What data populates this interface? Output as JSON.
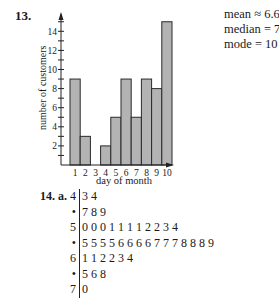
{
  "problem13": {
    "number": "13.",
    "stats": {
      "mean": "mean ≈ 6.63",
      "median": "median = 7",
      "mode": "mode = 10"
    }
  },
  "chart_data": {
    "type": "bar",
    "title": "",
    "xlabel": "day of month",
    "ylabel": "number of customers",
    "categories": [
      "1",
      "2",
      "3",
      "4",
      "5",
      "6",
      "7",
      "8",
      "9",
      "10"
    ],
    "values": [
      9,
      3,
      0,
      2,
      5,
      9,
      5,
      9,
      8,
      15
    ],
    "ylim": [
      0,
      16
    ],
    "yticks": [
      2,
      4,
      6,
      8,
      10,
      12,
      14
    ],
    "grid": false,
    "legend": null,
    "bar_color": "#b3b3b3",
    "annotations": [
      "mean ≈ 6.63",
      "median = 7",
      "mode = 10"
    ]
  },
  "problem14": {
    "number": "14. a.",
    "stem_leaf": [
      {
        "stem": "4",
        "leaves": "3 4"
      },
      {
        "stem": "•",
        "leaves": "7 8 9"
      },
      {
        "stem": "5",
        "leaves": "0 0 0 1 1 1 1 2 2 3 4"
      },
      {
        "stem": "•",
        "leaves": "5 5 5 5 6 6 6 6 7 7 7 8 8 8 9"
      },
      {
        "stem": "6",
        "leaves": "1 1 2 2 3 4"
      },
      {
        "stem": "•",
        "leaves": "5 6 8"
      },
      {
        "stem": "7",
        "leaves": "0"
      }
    ]
  }
}
